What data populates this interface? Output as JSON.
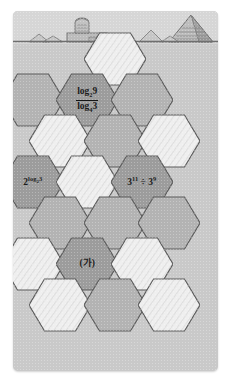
{
  "figure": {
    "title_strip": "",
    "scene": {
      "name": "egyptian-desert-scene",
      "elements": [
        "sphinx",
        "great-pyramid",
        "sand-dunes",
        "horizon-line"
      ],
      "sky_color": "#d6d6d6",
      "sand_color": "#c9c9c9"
    },
    "grid": {
      "type": "hexagonal-honeycomb",
      "columns": 3,
      "rows": 7,
      "light_fill": "#efefef",
      "mid_fill": "#b3b3b3",
      "dark_fill": "#9c9c9c",
      "stroke": "#5e5e5e"
    },
    "cells": [
      {
        "id": "r0c1",
        "col": 1,
        "row": 0,
        "shade": "light",
        "label": ""
      },
      {
        "id": "r1c0",
        "col": 0,
        "row": 1,
        "shade": "mid",
        "label": ""
      },
      {
        "id": "r1c1",
        "col": 1,
        "row": 1,
        "shade": "dark",
        "label_kind": "fraction",
        "numerator_base": "log",
        "numerator_sub": "2",
        "numerator_arg": "9",
        "denominator_base": "log",
        "denominator_sub": "4",
        "denominator_arg": "3",
        "label_plain": "log₂ 9 / log₄ 3"
      },
      {
        "id": "r1c2",
        "col": 2,
        "row": 1,
        "shade": "mid",
        "label": ""
      },
      {
        "id": "r2c0",
        "col": 0,
        "row": 2,
        "shade": "light",
        "label": ""
      },
      {
        "id": "r2c1",
        "col": 1,
        "row": 2,
        "shade": "mid",
        "label": ""
      },
      {
        "id": "r2c2",
        "col": 2,
        "row": 2,
        "shade": "light",
        "label": ""
      },
      {
        "id": "r3c0",
        "col": 0,
        "row": 3,
        "shade": "dark",
        "label_kind": "power-log",
        "base": "2",
        "exp_base": "log",
        "exp_sub": "2",
        "exp_arg": "3",
        "label_plain": "2^(log₂ 3)"
      },
      {
        "id": "r3c1",
        "col": 1,
        "row": 3,
        "shade": "light",
        "label": ""
      },
      {
        "id": "r3c2",
        "col": 2,
        "row": 3,
        "shade": "dark",
        "label_kind": "power-divide",
        "left_base": "3",
        "left_exp": "11",
        "operator": "÷",
        "right_base": "3",
        "right_exp": "9",
        "label_plain": "3¹¹ ÷ 3⁹"
      },
      {
        "id": "r4c0",
        "col": 0,
        "row": 4,
        "shade": "mid",
        "label": ""
      },
      {
        "id": "r4c1",
        "col": 1,
        "row": 4,
        "shade": "mid",
        "label": ""
      },
      {
        "id": "r4c2",
        "col": 2,
        "row": 4,
        "shade": "mid",
        "label": ""
      },
      {
        "id": "r5c0",
        "col": 0,
        "row": 5,
        "shade": "light",
        "label": ""
      },
      {
        "id": "r5c1",
        "col": 1,
        "row": 5,
        "shade": "dark",
        "label_kind": "text",
        "label": "(가)",
        "label_plain": "(가)"
      },
      {
        "id": "r5c2",
        "col": 2,
        "row": 5,
        "shade": "light",
        "label": ""
      },
      {
        "id": "r6c0",
        "col": 0,
        "row": 6,
        "shade": "light",
        "label": ""
      },
      {
        "id": "r6c1",
        "col": 1,
        "row": 6,
        "shade": "mid",
        "label": ""
      },
      {
        "id": "r6c2",
        "col": 2,
        "row": 6,
        "shade": "light",
        "label": ""
      }
    ]
  }
}
